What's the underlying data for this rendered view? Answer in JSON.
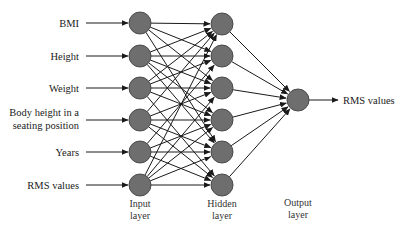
{
  "colors": {
    "node_fill": "#6e6e6e",
    "node_stroke": "#4a4a4a",
    "edge": "#1a1a1a",
    "text": "#1a1a1a"
  },
  "inputs": [
    {
      "label": "BMI",
      "lines": [
        "BMI"
      ],
      "y": 23
    },
    {
      "label": "Height",
      "lines": [
        "Height"
      ],
      "y": 56
    },
    {
      "label": "Weight",
      "lines": [
        "Weight"
      ],
      "y": 88
    },
    {
      "label": "Body height in a seating position",
      "lines": [
        "Body height in a",
        "seating position"
      ],
      "y": 120
    },
    {
      "label": "Years",
      "lines": [
        "Years"
      ],
      "y": 152
    },
    {
      "label": "RMS values",
      "lines": [
        "RMS values"
      ],
      "y": 185
    }
  ],
  "layers": {
    "input": {
      "label_line1": "Input",
      "label_line2": "layer",
      "x": 140
    },
    "hidden": {
      "label_line1": "Hidden",
      "label_line2": "layer",
      "x": 222
    },
    "output": {
      "label_line1": "Output",
      "label_line2": "layer",
      "x": 298
    }
  },
  "hidden_nodes_y": [
    24,
    56,
    88,
    120,
    152,
    185
  ],
  "output_node": {
    "x": 298,
    "y": 100
  },
  "output_label": "RMS values",
  "node_radius": 11,
  "connections": [
    [
      0,
      0
    ],
    [
      0,
      1
    ],
    [
      0,
      2
    ],
    [
      0,
      4
    ],
    [
      1,
      0
    ],
    [
      1,
      1
    ],
    [
      1,
      2
    ],
    [
      1,
      3
    ],
    [
      1,
      4
    ],
    [
      2,
      0
    ],
    [
      2,
      1
    ],
    [
      2,
      2
    ],
    [
      2,
      3
    ],
    [
      2,
      5
    ],
    [
      3,
      0
    ],
    [
      3,
      2
    ],
    [
      3,
      3
    ],
    [
      3,
      4
    ],
    [
      3,
      5
    ],
    [
      4,
      1
    ],
    [
      4,
      3
    ],
    [
      4,
      4
    ],
    [
      4,
      5
    ],
    [
      5,
      0
    ],
    [
      5,
      2
    ],
    [
      5,
      3
    ],
    [
      5,
      4
    ],
    [
      5,
      5
    ]
  ]
}
